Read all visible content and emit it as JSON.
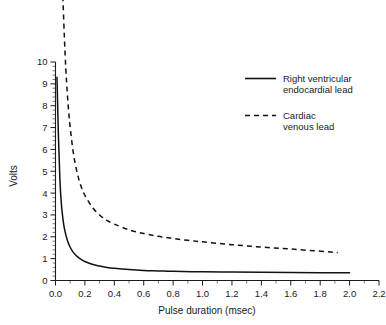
{
  "chart_data": {
    "type": "line",
    "title": "",
    "xlabel": "Pulse duration (msec)",
    "ylabel": "Volts",
    "xlim": [
      0.0,
      2.2
    ],
    "ylim": [
      0,
      10
    ],
    "grid": false,
    "legend_position": "upper-right",
    "xticks": [
      "0.0",
      "0.2",
      "0.4",
      "0.6",
      "0.8",
      "1.0",
      "1.2",
      "1.4",
      "1.6",
      "1.8",
      "2.0",
      "2.2"
    ],
    "xtick_values": [
      0.0,
      0.2,
      0.4,
      0.6,
      0.8,
      1.0,
      1.2,
      1.4,
      1.6,
      1.8,
      2.0,
      2.2
    ],
    "yticks": [
      "0",
      "1",
      "2",
      "3",
      "4",
      "5",
      "6",
      "7",
      "8",
      "9",
      "10"
    ],
    "ytick_values": [
      0,
      1,
      2,
      3,
      4,
      5,
      6,
      7,
      8,
      9,
      10
    ],
    "x_minor_step": 0.1,
    "y_minor_step": 0.2,
    "series": [
      {
        "name": "Right ventricular endocardial lead",
        "style": "solid",
        "color": "#111111",
        "x": [
          0.01,
          0.02,
          0.03,
          0.04,
          0.05,
          0.06,
          0.08,
          0.1,
          0.12,
          0.15,
          0.18,
          0.2,
          0.25,
          0.3,
          0.35,
          0.4,
          0.5,
          0.6,
          0.7,
          0.8,
          1.0,
          1.2,
          1.4,
          1.6,
          1.8,
          2.0
        ],
        "y": [
          9.3,
          6.6,
          4.6,
          3.5,
          2.85,
          2.4,
          1.85,
          1.52,
          1.3,
          1.08,
          0.94,
          0.87,
          0.74,
          0.66,
          0.6,
          0.56,
          0.5,
          0.46,
          0.44,
          0.42,
          0.4,
          0.39,
          0.38,
          0.37,
          0.36,
          0.35
        ]
      },
      {
        "name": "Cardiac venous lead",
        "style": "dashed",
        "color": "#111111",
        "x": [
          0.05,
          0.06,
          0.07,
          0.08,
          0.09,
          0.1,
          0.12,
          0.14,
          0.16,
          0.18,
          0.2,
          0.25,
          0.3,
          0.35,
          0.4,
          0.5,
          0.6,
          0.7,
          0.8,
          0.9,
          1.0,
          1.2,
          1.4,
          1.6,
          1.8,
          1.92
        ],
        "y": [
          13.0,
          11.2,
          9.7,
          8.6,
          7.7,
          7.0,
          5.9,
          5.15,
          4.6,
          4.2,
          3.9,
          3.35,
          3.0,
          2.75,
          2.58,
          2.32,
          2.15,
          2.02,
          1.92,
          1.84,
          1.77,
          1.64,
          1.53,
          1.44,
          1.34,
          1.28
        ]
      }
    ]
  },
  "legend": {
    "entries": [
      {
        "label_line1": "Right ventricular",
        "label_line2": "endocardial lead",
        "style": "solid"
      },
      {
        "label_line1": "Cardiac",
        "label_line2": "venous lead",
        "style": "dashed"
      }
    ]
  },
  "axes": {
    "x_title": "Pulse duration (msec)",
    "y_title": "Volts",
    "x_tick_labels": [
      "0.0",
      "0.2",
      "0.4",
      "0.6",
      "0.8",
      "1.0",
      "1.2",
      "1.4",
      "1.6",
      "1.8",
      "2.0",
      "2.2"
    ],
    "y_tick_labels": [
      "0",
      "1",
      "2",
      "3",
      "4",
      "5",
      "6",
      "7",
      "8",
      "9",
      "10"
    ]
  },
  "colors": {
    "background": "#ffffff",
    "ink": "#1a1a1a",
    "series": "#111111"
  }
}
